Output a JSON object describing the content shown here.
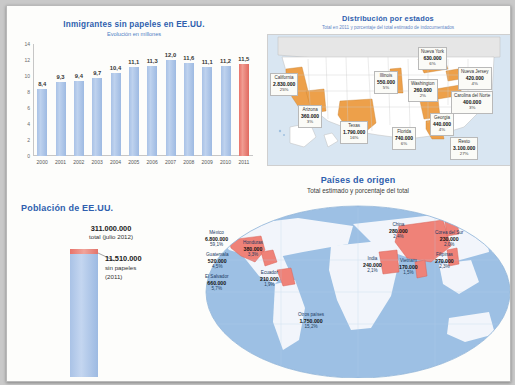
{
  "bar_section": {
    "title": "Inmigrantes sin papeles en EE.UU.",
    "subtitle": "Evolución en millones"
  },
  "population": {
    "title": "Población de EE.UU.",
    "total_value": "311.000.000",
    "total_label": "total (julio 2012)",
    "undocumented_value": "11.510.000",
    "undocumented_label": "sin papeles",
    "undocumented_year": "(2011)"
  },
  "us_map": {
    "title": "Distribución por estados",
    "subtitle": "Total en 2011 y porcentaje del total estimado de indocumentados"
  },
  "world_map": {
    "title": "Países de origen",
    "subtitle": "Total estimado y porcentaje del total"
  },
  "colors": {
    "bar_blue": "#a9c2e6",
    "bar_red": "#e8736a",
    "title_blue": "#2f5fae",
    "state_fill": "#eda04a",
    "ocean": "#d9e6f2"
  },
  "chart_data": [
    {
      "type": "bar",
      "title": "Inmigrantes sin papeles en EE.UU.",
      "subtitle": "Evolución en millones",
      "xlabel": "",
      "ylabel": "",
      "ylim": [
        0,
        14
      ],
      "yticks": [
        "0",
        "2",
        "4",
        "6",
        "8",
        "10",
        "12",
        "14"
      ],
      "grid": false,
      "categories": [
        "2000",
        "2001",
        "2002",
        "2003",
        "2004",
        "2005",
        "2006",
        "2007",
        "2008",
        "2009",
        "2010",
        "2011"
      ],
      "values": [
        8.4,
        9.3,
        9.4,
        9.7,
        10.4,
        11.1,
        11.3,
        12.0,
        11.6,
        11.1,
        11.2,
        11.5
      ],
      "labels": [
        "8,4",
        "9,3",
        "9,4",
        "9,7",
        "10,4",
        "11,1",
        "11,3",
        "12,0",
        "11,6",
        "11,1",
        "11,2",
        "11,5"
      ],
      "highlight_index": 11
    },
    {
      "type": "bar",
      "title": "Población de EE.UU.",
      "categories": [
        "Total EE.UU.",
        "Sin papeles"
      ],
      "values": [
        311000000,
        11510000
      ],
      "labels": [
        "311.000.000",
        "11.510.000"
      ]
    },
    {
      "type": "map",
      "title": "Distribución por estados",
      "subtitle": "Total en 2011 y porcentaje del total estimado de indocumentados",
      "regions": [
        {
          "name": "California",
          "value": "2.830.000",
          "pct": "25%",
          "x": 2,
          "y": 38
        },
        {
          "name": "Arizona",
          "value": "360.000",
          "pct": "3%",
          "x": 30,
          "y": 70
        },
        {
          "name": "Texas",
          "value": "1.790.000",
          "pct": "16%",
          "x": 72,
          "y": 86
        },
        {
          "name": "Illinois",
          "value": "550.000",
          "pct": "5%",
          "x": 106,
          "y": 36
        },
        {
          "name": "Washington",
          "value": "260.000",
          "pct": "2%",
          "x": 140,
          "y": 44
        },
        {
          "name": "Nueva York",
          "value": "630.000",
          "pct": "6%",
          "x": 150,
          "y": 12
        },
        {
          "name": "Nueva Jersey",
          "value": "420.000",
          "pct": "4%",
          "x": 190,
          "y": 32
        },
        {
          "name": "Carolina del Norte",
          "value": "400.000",
          "pct": "3%",
          "x": 183,
          "y": 56
        },
        {
          "name": "Georgia",
          "value": "440.000",
          "pct": "4%",
          "x": 162,
          "y": 78
        },
        {
          "name": "Florida",
          "value": "740.000",
          "pct": "6%",
          "x": 124,
          "y": 92
        },
        {
          "name": "Resto",
          "value": "3.100.000",
          "pct": "27%",
          "x": 182,
          "y": 102
        }
      ]
    },
    {
      "type": "map",
      "title": "Países de origen",
      "subtitle": "Total estimado y porcentaje del total",
      "regions": [
        {
          "name": "México",
          "value": "6.800.000",
          "pct": "59,1%",
          "x": 2,
          "y": 30
        },
        {
          "name": "Guatemala",
          "value": "520.000",
          "pct": "4,5%",
          "x": 3,
          "y": 52
        },
        {
          "name": "El Salvador",
          "value": "660.000",
          "pct": "5,7%",
          "x": 2,
          "y": 74
        },
        {
          "name": "Honduras",
          "value": "380.000",
          "pct": "3,3%",
          "x": 40,
          "y": 40
        },
        {
          "name": "Ecuador",
          "value": "210.000",
          "pct": "1,9%",
          "x": 57,
          "y": 70
        },
        {
          "name": "Otros países",
          "value": "1.750.000",
          "pct": "15,2%",
          "x": 95,
          "y": 112
        },
        {
          "name": "India",
          "value": "240.000",
          "pct": "2,1%",
          "x": 160,
          "y": 56
        },
        {
          "name": "China",
          "value": "280.000",
          "pct": "2,4%",
          "x": 186,
          "y": 22
        },
        {
          "name": "Vietnam",
          "value": "170.000",
          "pct": "1,5%",
          "x": 196,
          "y": 58
        },
        {
          "name": "Corea del Sur",
          "value": "230.000",
          "pct": "2,0%",
          "x": 232,
          "y": 30
        },
        {
          "name": "Filipinas",
          "value": "270.000",
          "pct": "2,3%",
          "x": 232,
          "y": 52
        }
      ]
    }
  ]
}
